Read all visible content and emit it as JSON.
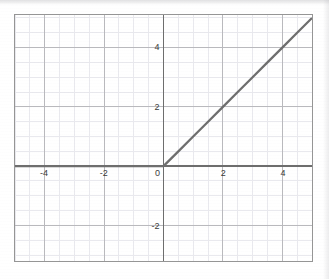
{
  "chart_data": {
    "type": "line",
    "title": "",
    "xlabel": "",
    "ylabel": "",
    "xlim": [
      -5.0,
      5.0
    ],
    "ylim": [
      -3.2,
      5.1
    ],
    "grid": true,
    "grid_major_step": 2,
    "grid_minor_step": 0.5,
    "legend": "none",
    "xticks": [
      -4,
      -2,
      0,
      2,
      4
    ],
    "xtick_labels": [
      "-4",
      "-2",
      "0",
      "2",
      "4"
    ],
    "yticks": [
      -2,
      2,
      4
    ],
    "ytick_labels": [
      "-2",
      "2",
      "4"
    ],
    "origin_label": "0",
    "series": [
      {
        "name": "relu",
        "function": "y = max(0, x)",
        "x": [
          -5.0,
          -4.5,
          -4.0,
          -3.5,
          -3.0,
          -2.5,
          -2.0,
          -1.5,
          -1.0,
          -0.5,
          0.0,
          0.5,
          1.0,
          1.5,
          2.0,
          2.5,
          3.0,
          3.5,
          4.0,
          4.5,
          5.0
        ],
        "y": [
          0.0,
          0.0,
          0.0,
          0.0,
          0.0,
          0.0,
          0.0,
          0.0,
          0.0,
          0.0,
          0.0,
          0.5,
          1.0,
          1.5,
          2.0,
          2.5,
          3.0,
          3.5,
          4.0,
          4.5,
          5.0
        ]
      }
    ],
    "colors": {
      "series_line": "#6e6e6e",
      "axis_line": "#6d6d6d",
      "grid_major": "#b8b8bc",
      "grid_minor": "#e9e9ee",
      "frame": "#959595",
      "tick_text": "#3a3a3a",
      "background": "#ffffff"
    }
  }
}
